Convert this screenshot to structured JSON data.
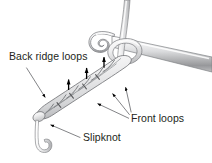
{
  "figure": {
    "background_color": "#ffffff",
    "labels": [
      {
        "id": "back-ridge-loops",
        "text": "Back ridge loops",
        "x": 9,
        "y": 60
      },
      {
        "id": "front-loops",
        "text": "Front loops",
        "x": 131,
        "y": 122
      },
      {
        "id": "slipknot",
        "text": "Slipknot",
        "x": 83,
        "y": 141
      }
    ],
    "colors": {
      "outline": "#58595b",
      "yarn_light": "#f2f2f2",
      "yarn_mid": "#d9d9d9",
      "yarn_shadow": "#b0b1b3",
      "hook_light": "#fafafa",
      "hook_mid": "#d2d3d5",
      "hook_dark": "#939598",
      "text": "#231f20",
      "leader_line": "#6d6e71",
      "arrowhead": "#000000"
    },
    "elements": {
      "hook": "crochet hook with curved throat entering from upper right",
      "working_yarn": "yarn strand rising from the loop to the top edge",
      "working_loop": "loop of yarn wrapped around the hook shaft",
      "chain": "row of chain stitches running diagonally down to the left",
      "yarn_tail": "short tail hanging below the slipknot",
      "back_ridge_arrows": "three short upward arrows above the chain",
      "front_loop_arrows": "three leader arrows pointing at the front loops",
      "slipknot_arrow": "leader arrow pointing at the slipknot"
    },
    "counts": {
      "back_ridge_arrows": 3,
      "front_loop_leaders": 3,
      "chain_stitches": 5
    }
  }
}
